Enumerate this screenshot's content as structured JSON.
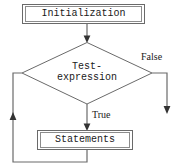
{
  "diagram": {
    "type": "flowchart",
    "background_color": "#ffffff",
    "line_color": "#555555",
    "text_color": "#1a1a1a",
    "nodes": [
      {
        "id": "initialization",
        "shape": "rectangle-double-border",
        "label": "Initialization",
        "font": "monospace"
      },
      {
        "id": "test-expression",
        "shape": "diamond",
        "label_line1": "Test-",
        "label_line2": "expression",
        "font": "monospace"
      },
      {
        "id": "statements",
        "shape": "rectangle-double-border",
        "label": "Statements",
        "font": "monospace"
      }
    ],
    "edges": [
      {
        "id": "init-to-test",
        "from": "initialization",
        "to": "test-expression",
        "label": "",
        "arrow": "down"
      },
      {
        "id": "test-false-exit",
        "from": "test-expression",
        "to": "exit",
        "label": "False",
        "arrow": "down",
        "font": "serif"
      },
      {
        "id": "test-true-to-statements",
        "from": "test-expression",
        "to": "statements",
        "label": "True",
        "arrow": "down",
        "font": "serif"
      },
      {
        "id": "statements-loop-back",
        "from": "statements",
        "to": "test-expression",
        "label": "",
        "arrow": "up"
      }
    ]
  }
}
